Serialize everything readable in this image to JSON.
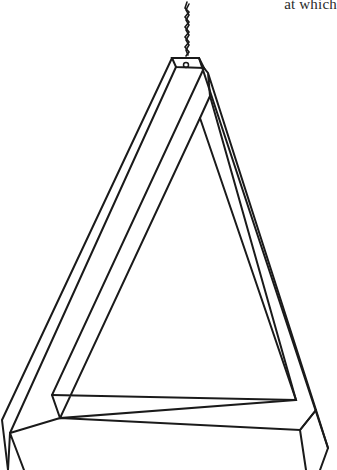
{
  "caption": {
    "text": "at which"
  },
  "figure": {
    "stroke_color": "#1a1a1a",
    "background_color": "#ffffff"
  }
}
